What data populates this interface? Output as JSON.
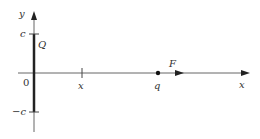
{
  "diagram": {
    "labels": {
      "y_axis": "y",
      "x_axis": "x",
      "c_top": "c",
      "c_bottom": "−c",
      "origin": "0",
      "charge_line": "Q",
      "point_x": "x",
      "point_charge": "q",
      "force": "F"
    },
    "colors": {
      "axis": "#555555",
      "line_charge": "#222222",
      "text": "#333333"
    }
  }
}
